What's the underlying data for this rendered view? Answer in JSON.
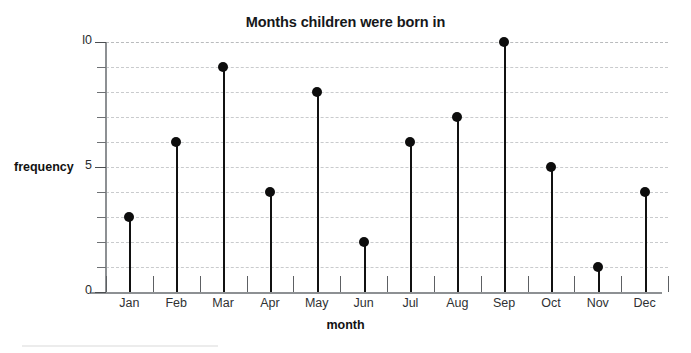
{
  "chart_data": {
    "type": "bar",
    "render_style": "stem-and-dot (lollipop)",
    "title": "Months children were born in",
    "xlabel": "month",
    "ylabel": "frequency",
    "categories": [
      "Jan",
      "Feb",
      "Mar",
      "Apr",
      "May",
      "Jun",
      "Jul",
      "Aug",
      "Sep",
      "Oct",
      "Nov",
      "Dec"
    ],
    "values": [
      3,
      6,
      9,
      4,
      8,
      2,
      6,
      7,
      10,
      5,
      1,
      4
    ],
    "ylim": [
      0,
      10
    ],
    "xlim_categories": 12,
    "y_tick_labels": [
      "0",
      "5",
      "l0"
    ],
    "y_tick_label_values": [
      0,
      5,
      10
    ],
    "y_minor_tick_values": [
      1,
      2,
      3,
      4,
      6,
      7,
      8,
      9
    ],
    "grid": true,
    "grid_axis": "y",
    "grid_style": "dashed",
    "grid_values": [
      1,
      2,
      3,
      4,
      5,
      6,
      7,
      8,
      9,
      10
    ],
    "legend": null,
    "legend_position": "none",
    "colors": {
      "marker": "#0d0d0d",
      "stem": "#111111",
      "gridline": "#c9cbcd",
      "axis": "#8d9093",
      "text": "#111111",
      "background": "#ffffff"
    }
  }
}
